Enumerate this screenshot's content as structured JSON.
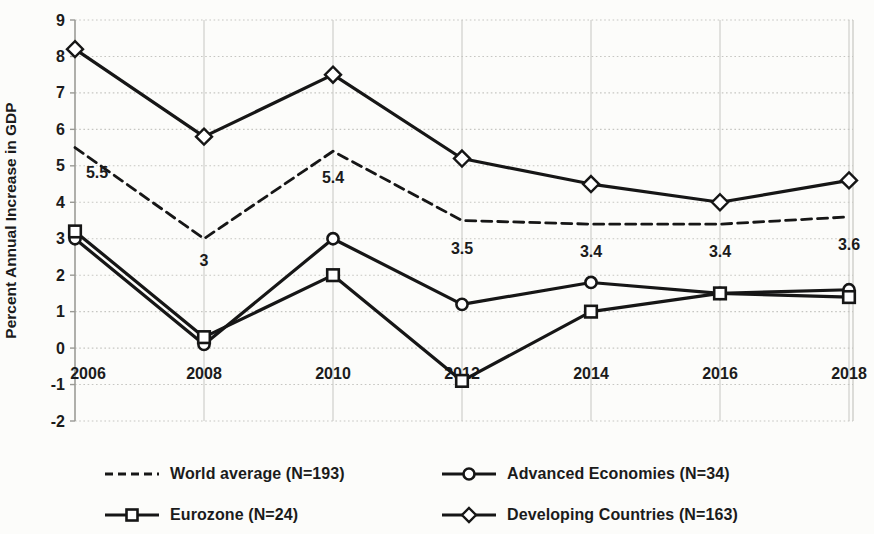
{
  "chart_data": {
    "type": "line",
    "title": "",
    "xlabel": "",
    "ylabel": "Percent Annual Increase in GDP",
    "categories": [
      "2006",
      "2008",
      "2010",
      "2012",
      "2014",
      "2016",
      "2018"
    ],
    "ylim": [
      -2,
      9
    ],
    "yticks": [
      "9",
      "8",
      "7",
      "6",
      "5",
      "4",
      "3",
      "2",
      "1",
      "0",
      "-1",
      "-2"
    ],
    "ytick_values": [
      9,
      8,
      7,
      6,
      5,
      4,
      3,
      2,
      1,
      0,
      -1,
      -2
    ],
    "grid": true,
    "legend_position": "bottom",
    "series": [
      {
        "name": "World average (N=193)",
        "marker": "none",
        "line_style": "dashed",
        "values": [
          5.5,
          3.0,
          5.4,
          3.5,
          3.4,
          3.4,
          3.6
        ],
        "data_labels": [
          "5.5",
          "3",
          "5.4",
          "3.5",
          "3.4",
          "3.4",
          "3.6"
        ]
      },
      {
        "name": "Advanced Economies (N=34)",
        "marker": "circle",
        "line_style": "solid",
        "values": [
          3.0,
          0.1,
          3.0,
          1.2,
          1.8,
          1.5,
          1.6
        ],
        "data_labels": []
      },
      {
        "name": "Eurozone (N=24)",
        "marker": "square",
        "line_style": "solid",
        "values": [
          3.2,
          0.3,
          2.0,
          -0.9,
          1.0,
          1.5,
          1.4
        ],
        "data_labels": []
      },
      {
        "name": "Developing Countries (N=163)",
        "marker": "diamond",
        "line_style": "solid",
        "values": [
          8.2,
          5.8,
          7.5,
          5.2,
          4.5,
          4.0,
          4.6
        ],
        "data_labels": []
      }
    ],
    "colors": {
      "line": "#161616",
      "text": "#1b1b1b",
      "grid": "#c6c6c2",
      "axis": "#9a9a95",
      "background": "#fcfcfa",
      "marker_fill": "#ffffff"
    }
  }
}
